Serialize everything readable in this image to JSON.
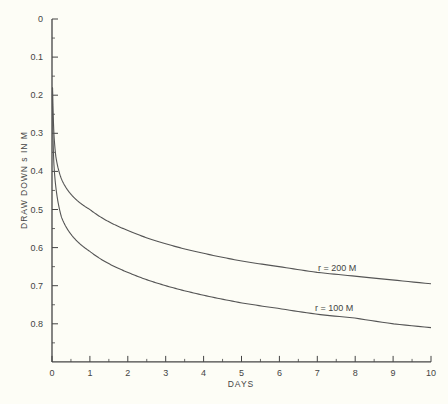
{
  "chart_data": {
    "type": "line",
    "title": "",
    "xlabel": "DAYS",
    "ylabel": "DRAW DOWN s IN M",
    "xlim": [
      0,
      10
    ],
    "ylim": [
      0,
      0.9
    ],
    "y_inverted": true,
    "grid": false,
    "legend_position": "inline labels at right end of curves",
    "x_ticks": [
      "0",
      "1",
      "2",
      "3",
      "4",
      "5",
      "6",
      "7",
      "8",
      "9",
      "10"
    ],
    "y_ticks": [
      "0",
      "0.1",
      "0.2",
      "0.3",
      "0.4",
      "0.5",
      "0.6",
      "0.7",
      "0.8"
    ],
    "series": [
      {
        "name": "r = 200 M",
        "x": [
          0.02,
          0.05,
          0.1,
          0.25,
          0.5,
          1,
          2,
          3,
          4,
          5,
          6,
          7,
          8,
          9,
          10
        ],
        "values": [
          0.2,
          0.3,
          0.36,
          0.42,
          0.46,
          0.5,
          0.555,
          0.59,
          0.615,
          0.635,
          0.65,
          0.665,
          0.675,
          0.685,
          0.695
        ]
      },
      {
        "name": "r = 100 M",
        "x": [
          0.01,
          0.05,
          0.1,
          0.25,
          0.5,
          1,
          2,
          3,
          4,
          5,
          6,
          7,
          8,
          9,
          10
        ],
        "values": [
          0.2,
          0.38,
          0.44,
          0.52,
          0.565,
          0.61,
          0.665,
          0.7,
          0.725,
          0.745,
          0.76,
          0.775,
          0.785,
          0.8,
          0.81
        ]
      }
    ]
  },
  "labels": {
    "xlabel": "DAYS",
    "ylabel": "DRAW DOWN s IN M",
    "series_0": "r = 200 M",
    "series_1": "r = 100 M"
  },
  "colors": {
    "background": "#fdfdf6",
    "line": "#555555",
    "axis": "#444444"
  }
}
